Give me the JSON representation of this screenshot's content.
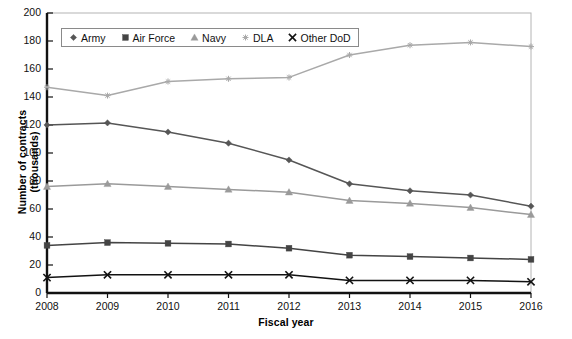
{
  "chart_data": {
    "type": "line",
    "title": "",
    "xlabel": "Fiscal year",
    "ylabel": "Number of contracts (thousands)",
    "x": [
      2008,
      2009,
      2010,
      2011,
      2012,
      2013,
      2014,
      2015,
      2016
    ],
    "xtick_labels": [
      "2008",
      "2009",
      "2010",
      "2011",
      "2012",
      "2013",
      "2014",
      "2015",
      "2016"
    ],
    "ytick_labels": [
      "0",
      "20",
      "40",
      "60",
      "80",
      "100",
      "120",
      "140",
      "160",
      "180",
      "200"
    ],
    "yticks": [
      0,
      20,
      40,
      60,
      80,
      100,
      120,
      140,
      160,
      180,
      200
    ],
    "ylim": [
      0,
      200
    ],
    "xlim": [
      2008,
      2016
    ],
    "grid": false,
    "legend_position": "top-left-inside",
    "series": [
      {
        "name": "Army",
        "marker": "diamond",
        "color": "#565656",
        "values": [
          120,
          121.5,
          115,
          107,
          95,
          78,
          73,
          70,
          62
        ]
      },
      {
        "name": "Air Force",
        "marker": "square",
        "color": "#444444",
        "values": [
          34,
          36,
          35.5,
          35,
          32,
          27,
          26,
          25,
          24
        ]
      },
      {
        "name": "Navy",
        "marker": "triangle",
        "color": "#9a9a9a",
        "values": [
          76,
          78,
          76,
          74,
          72,
          66,
          64,
          61,
          56
        ]
      },
      {
        "name": "DLA",
        "marker": "star",
        "color": "#a9a9a9",
        "values": [
          147,
          141,
          151,
          153,
          154,
          170,
          177,
          179,
          176
        ]
      },
      {
        "name": "Other DoD",
        "marker": "cross",
        "color": "#121212",
        "values": [
          11,
          13,
          13,
          13,
          13,
          9,
          9,
          9,
          8
        ]
      }
    ]
  },
  "legend": {
    "items": [
      {
        "label": "Army",
        "marker": "diamond-marker-icon"
      },
      {
        "label": "Air Force",
        "marker": "square-marker-icon"
      },
      {
        "label": "Navy",
        "marker": "triangle-marker-icon"
      },
      {
        "label": "DLA",
        "marker": "star-marker-icon"
      },
      {
        "label": "Other DoD",
        "marker": "cross-marker-icon"
      }
    ]
  },
  "axes": {
    "y_title": "Number of contracts (thousands)",
    "x_title": "Fiscal year"
  }
}
